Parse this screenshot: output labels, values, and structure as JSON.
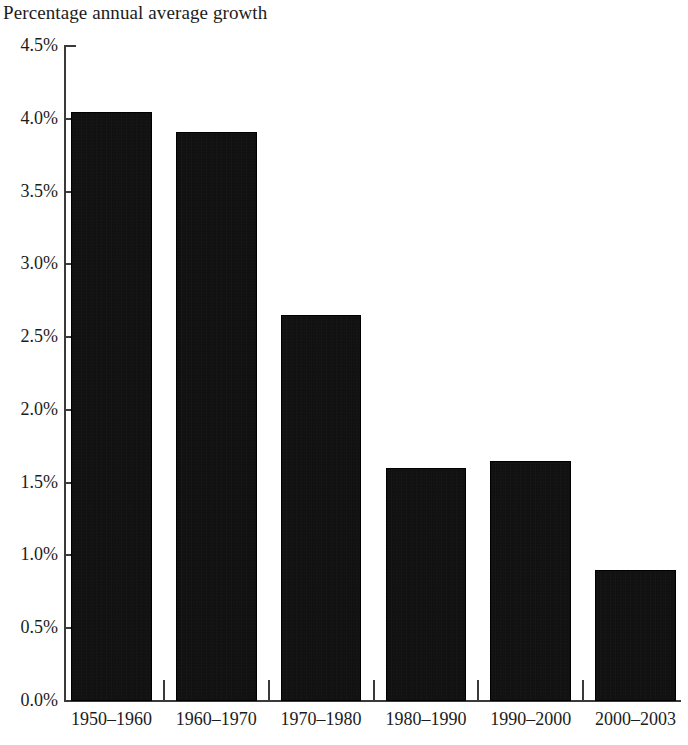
{
  "chart_data": {
    "type": "bar",
    "title": "Percentage annual average growth",
    "xlabel": "",
    "ylabel": "",
    "categories": [
      "1950–1960",
      "1960–1970",
      "1970–1980",
      "1980–1990",
      "1990–2000",
      "2000–2003"
    ],
    "values": [
      4.05,
      3.91,
      2.65,
      1.6,
      1.65,
      0.9
    ],
    "ylim": [
      0.0,
      4.5
    ],
    "ytick_values": [
      0.0,
      0.5,
      1.0,
      1.5,
      2.0,
      2.5,
      3.0,
      3.5,
      4.0,
      4.5
    ],
    "ytick_labels": [
      "0.0%",
      "0.5%",
      "1.0%",
      "1.5%",
      "2.0%",
      "2.5%",
      "3.0%",
      "3.5%",
      "4.0%",
      "4.5%"
    ],
    "grid": false,
    "legend": null,
    "bar_color": "#0d0d0d",
    "axis_color": "#3a3a3a"
  }
}
